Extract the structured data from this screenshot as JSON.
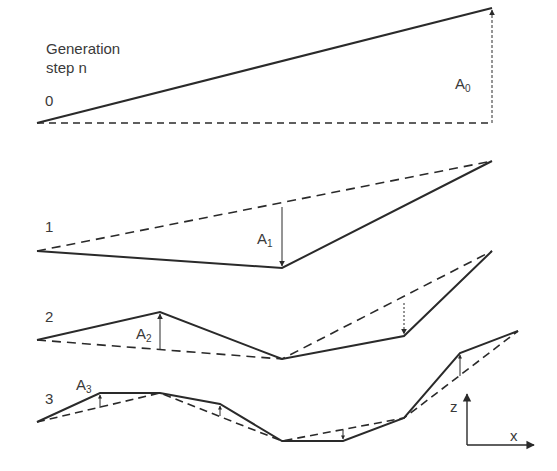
{
  "title": {
    "line1": "Generation",
    "line2": "step n"
  },
  "steps": [
    {
      "n": "0",
      "amplitude": "A",
      "amplitude_sub": "0"
    },
    {
      "n": "1",
      "amplitude": "A",
      "amplitude_sub": "1"
    },
    {
      "n": "2",
      "amplitude": "A",
      "amplitude_sub": "2"
    },
    {
      "n": "3",
      "amplitude": "A",
      "amplitude_sub": "3"
    }
  ],
  "axes": {
    "vertical": "z",
    "horizontal": "x"
  },
  "colors": {
    "line": "#2a2a2a"
  }
}
